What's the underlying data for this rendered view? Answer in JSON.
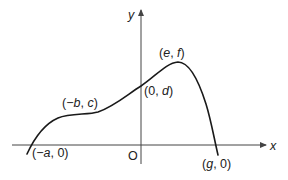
{
  "diagram": {
    "type": "function-sketch",
    "axes": {
      "x_label": "x",
      "y_label": "y",
      "origin_label": "O"
    },
    "points": [
      {
        "id": "x-intercept-left",
        "label_open": "(",
        "label_x": "−a",
        "label_sep": ", ",
        "label_y": "0",
        "label_close": ")"
      },
      {
        "id": "stationary-inflection",
        "label_open": "(",
        "label_x": "−b",
        "label_sep": ", ",
        "label_y": "c",
        "label_close": ")"
      },
      {
        "id": "y-intercept",
        "label_open": "(",
        "label_x": "0",
        "label_sep": ", ",
        "label_y": "d",
        "label_close": ")"
      },
      {
        "id": "maximum",
        "label_open": "(",
        "label_x": "e",
        "label_sep": ", ",
        "label_y": "f",
        "label_close": ")"
      },
      {
        "id": "x-intercept-right",
        "label_open": "(",
        "label_x": "g",
        "label_sep": ", ",
        "label_y": "0",
        "label_close": ")"
      }
    ]
  }
}
